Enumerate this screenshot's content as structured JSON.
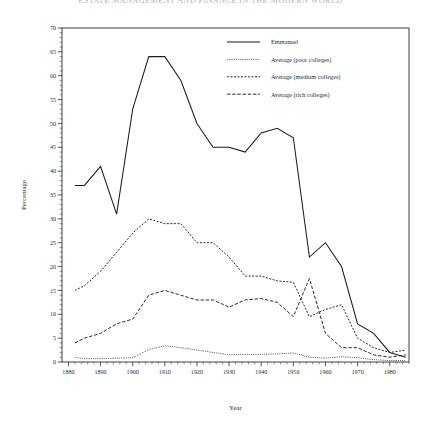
{
  "running_head": "Estate management and finance in the modern world",
  "figure": {
    "ylabel": "Percentage",
    "xlabel": "Year",
    "legend": [
      {
        "label": "Emmanuel",
        "style": "solid"
      },
      {
        "label": "Average (poor colleges)",
        "style": "dotted"
      },
      {
        "label": "Average (medium colleges)",
        "style": "dashed-short"
      },
      {
        "label": "Average (rich colleges)",
        "style": "dashed-long"
      }
    ]
  },
  "chart_data": {
    "type": "line",
    "title": "",
    "xlabel": "Year",
    "ylabel": "Percentage",
    "xlim": [
      1878,
      1986
    ],
    "ylim": [
      0,
      70
    ],
    "xticks": [
      1880,
      1890,
      1900,
      1910,
      1920,
      1930,
      1940,
      1950,
      1960,
      1970,
      1980
    ],
    "yticks": [
      0,
      5,
      10,
      15,
      20,
      25,
      30,
      35,
      40,
      45,
      50,
      55,
      60,
      65,
      70
    ],
    "ytick_step": 5,
    "yminor_step": 1,
    "xminor_step": 2,
    "grid": false,
    "legend_position": "top-right",
    "series": [
      {
        "name": "Emmanuel",
        "style": "solid",
        "x": [
          1882,
          1885,
          1890,
          1895,
          1900,
          1905,
          1910,
          1915,
          1920,
          1925,
          1930,
          1935,
          1940,
          1945,
          1950,
          1955,
          1960,
          1965,
          1970,
          1975,
          1980,
          1985
        ],
        "y": [
          37,
          37,
          41,
          31,
          53,
          64,
          64,
          59,
          50,
          45,
          45,
          44,
          48,
          49,
          47,
          22,
          25,
          20,
          8,
          6,
          2,
          1
        ]
      },
      {
        "name": "Average (poor colleges)",
        "style": "dotted",
        "x": [
          1882,
          1885,
          1890,
          1895,
          1900,
          1905,
          1910,
          1915,
          1920,
          1925,
          1930,
          1935,
          1940,
          1945,
          1950,
          1955,
          1960,
          1965,
          1970,
          1975,
          1980,
          1985
        ],
        "y": [
          1.0,
          0.7,
          0.7,
          0.8,
          0.9,
          2.6,
          3.4,
          3.0,
          2.5,
          2.0,
          1.5,
          1.6,
          1.6,
          1.7,
          1.9,
          1.0,
          0.8,
          1.1,
          0.9,
          0.5,
          0.3,
          0.3
        ]
      },
      {
        "name": "Average (medium colleges)",
        "style": "dashed-short",
        "x": [
          1882,
          1885,
          1890,
          1895,
          1900,
          1905,
          1910,
          1915,
          1920,
          1925,
          1930,
          1935,
          1940,
          1945,
          1950,
          1955,
          1960,
          1965,
          1970,
          1975,
          1980,
          1985
        ],
        "y": [
          15,
          16,
          19,
          23,
          27,
          30,
          29,
          29,
          25,
          25,
          22,
          18,
          18,
          17,
          16.7,
          9.5,
          11,
          12,
          5,
          3,
          2,
          2.5
        ]
      },
      {
        "name": "Average (rich colleges)",
        "style": "dashed-long",
        "x": [
          1882,
          1885,
          1890,
          1895,
          1900,
          1905,
          1910,
          1915,
          1920,
          1925,
          1930,
          1935,
          1940,
          1945,
          1950,
          1955,
          1960,
          1965,
          1970,
          1975,
          1980,
          1985
        ],
        "y": [
          4,
          5,
          6,
          8,
          9,
          14,
          15,
          14,
          13,
          13,
          11.5,
          13,
          13.3,
          12.5,
          9.5,
          17.5,
          6,
          3,
          3,
          1.5,
          1,
          1.5
        ]
      }
    ]
  }
}
